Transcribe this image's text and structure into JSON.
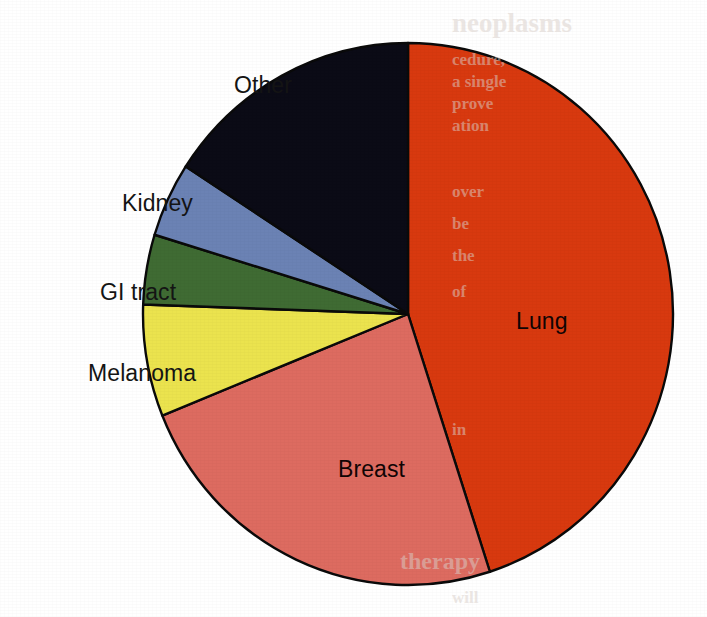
{
  "figure": {
    "background_color": "#ffffff",
    "label_text_color": "#141414",
    "slice_border_color": "#0a0a0a"
  },
  "chart_data": {
    "type": "pie",
    "title": "",
    "subtitle": "",
    "xlabel": "",
    "ylabel": "",
    "legend_position": "none",
    "labels_position": "callout-and-inside",
    "grid": false,
    "start_angle_deg": 0,
    "direction": "clockwise",
    "categories": [
      "Lung",
      "Breast",
      "Melanoma",
      "GI tract",
      "Kidney",
      "Other"
    ],
    "values": [
      45,
      24,
      7,
      4,
      5,
      15
    ],
    "units": "percent",
    "colors": [
      "#d8390f",
      "#dd6b60",
      "#ebe34e",
      "#3f6b33",
      "#6b82b4",
      "#0b0b16"
    ],
    "slices": [
      {
        "label": "Lung",
        "value": 45,
        "color": "#d8390f",
        "start_angle_deg": 0,
        "end_angle_deg": 162,
        "label_placement": "inside",
        "label_x": 516,
        "label_y": 308
      },
      {
        "label": "Breast",
        "value": 24,
        "color": "#dd6b60",
        "start_angle_deg": 162,
        "end_angle_deg": 248,
        "label_placement": "inside",
        "label_x": 338,
        "label_y": 456
      },
      {
        "label": "Melanoma",
        "value": 7,
        "color": "#ebe34e",
        "start_angle_deg": 248,
        "end_angle_deg": 272,
        "label_placement": "outside-left",
        "label_x": 88,
        "label_y": 360
      },
      {
        "label": "GI tract",
        "value": 4,
        "color": "#3f6b33",
        "start_angle_deg": 272,
        "end_angle_deg": 287,
        "label_placement": "outside-left",
        "label_x": 100,
        "label_y": 279
      },
      {
        "label": "Kidney",
        "value": 5,
        "color": "#6b82b4",
        "start_angle_deg": 287,
        "end_angle_deg": 303,
        "label_placement": "outside-left",
        "label_x": 122,
        "label_y": 190
      },
      {
        "label": "Other",
        "value": 15,
        "color": "#0b0b16",
        "start_angle_deg": 303,
        "end_angle_deg": 360,
        "label_placement": "outside-top-left",
        "label_x": 234,
        "label_y": 72
      }
    ]
  },
  "geometry": {
    "center_x": 408,
    "center_y": 314,
    "radius_x": 265,
    "radius_y": 271
  },
  "bleed_through": {
    "note": "faint reverse-side print showing through the scanned page",
    "lines": [
      {
        "text": "neoplasms",
        "x": 452,
        "y": 8,
        "size": 27
      },
      {
        "text": "cedure,",
        "x": 452,
        "y": 50,
        "size": 17
      },
      {
        "text": "a single",
        "x": 452,
        "y": 72,
        "size": 17
      },
      {
        "text": "prove",
        "x": 452,
        "y": 94,
        "size": 17
      },
      {
        "text": "ation",
        "x": 452,
        "y": 116,
        "size": 17
      },
      {
        "text": "over",
        "x": 452,
        "y": 182,
        "size": 17
      },
      {
        "text": "be",
        "x": 452,
        "y": 214,
        "size": 17
      },
      {
        "text": "the",
        "x": 452,
        "y": 246,
        "size": 17
      },
      {
        "text": "of",
        "x": 452,
        "y": 282,
        "size": 17
      },
      {
        "text": "in",
        "x": 452,
        "y": 420,
        "size": 17
      },
      {
        "text": "therapy",
        "x": 400,
        "y": 548,
        "size": 24
      },
      {
        "text": "will",
        "x": 452,
        "y": 588,
        "size": 17
      }
    ]
  }
}
